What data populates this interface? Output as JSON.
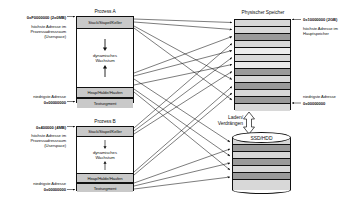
{
  "diagram": {
    "colors": {
      "segment_fill": "#c9c9c9",
      "page_used": "#9a9a9a",
      "page_free": "#d8d8d8",
      "outline": "#111111"
    }
  },
  "process_a": {
    "title": "Prozess A",
    "top_address": "0xF0000000 (2x0MB)",
    "top_note": "höchste Adresse im\nProzessadressraum\n(Userspace)",
    "top_note_lines": [
      "höchste Adresse im",
      "Prozessadressraum",
      "(Userspace)"
    ],
    "bottom_note": "niedrigste Adresse",
    "bottom_address": "0x00000000",
    "segments": [
      {
        "name": "stack",
        "label": "Stack/Stapel/Keller"
      },
      {
        "name": "growth",
        "label": "dynamisches\nWachstum",
        "label_lines": [
          "dynamisches",
          "Wachstum"
        ]
      },
      {
        "name": "heap",
        "label": "Heap/Halde/Haufen"
      },
      {
        "name": "text",
        "label": "Textsegment"
      }
    ]
  },
  "process_b": {
    "title": "Prozess B",
    "top_address": "0x400000 (4MB)",
    "top_note_lines": [
      "höchste Adresse im",
      "Prozessadressraum",
      "(Userspace)"
    ],
    "bottom_note": "niedrigste Adresse",
    "bottom_address": "0x00000000",
    "segments": [
      {
        "name": "stack",
        "label": "Stack/Stapel/Keller"
      },
      {
        "name": "growth",
        "label_lines": [
          "dynamisches",
          "Wachstum"
        ]
      },
      {
        "name": "heap",
        "label": "Heap/Halde/Haufen"
      },
      {
        "name": "text",
        "label": "Textsegment"
      }
    ]
  },
  "physical_memory": {
    "title": "Physischer Speicher",
    "top_address": "0x10000000 (2GB)",
    "top_note_lines": [
      "höchste Adresse im",
      "Hauptspeicher"
    ],
    "bottom_note": "niedrigste Adresse",
    "bottom_address": "0x00000000",
    "frames": [
      {
        "index": 0,
        "state": "free"
      },
      {
        "index": 1,
        "state": "free"
      },
      {
        "index": 2,
        "state": "used"
      },
      {
        "index": 3,
        "state": "free"
      },
      {
        "index": 4,
        "state": "free"
      },
      {
        "index": 5,
        "state": "free"
      },
      {
        "index": 6,
        "state": "free"
      },
      {
        "index": 7,
        "state": "used"
      },
      {
        "index": 8,
        "state": "free"
      },
      {
        "index": 9,
        "state": "used"
      },
      {
        "index": 10,
        "state": "free"
      },
      {
        "index": 11,
        "state": "used"
      },
      {
        "index": 12,
        "state": "free"
      }
    ]
  },
  "swap": {
    "title": "SSD/HDD",
    "transfer_label_lines": [
      "Laden/",
      "Verdrängen"
    ],
    "transfer_label": "Laden/ Verdrängen",
    "blocks": [
      {
        "index": 0,
        "state": "free"
      },
      {
        "index": 1,
        "state": "used"
      },
      {
        "index": 2,
        "state": "free"
      },
      {
        "index": 3,
        "state": "used"
      },
      {
        "index": 4,
        "state": "free"
      },
      {
        "index": 5,
        "state": "used"
      },
      {
        "index": 6,
        "state": "free"
      }
    ]
  }
}
